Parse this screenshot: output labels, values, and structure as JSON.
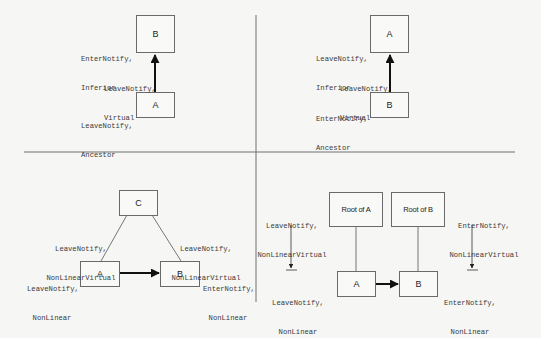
{
  "figure": {
    "colors": {
      "background": "#f6f6f4",
      "line": "#6a6a6a",
      "text": "#3a3a3a",
      "arrow": "#111111"
    }
  },
  "quadrants": {
    "top_left": {
      "boxes": {
        "upper": "B",
        "lower": "A"
      },
      "labels": {
        "upper": [
          "EnterNotify,",
          "Inferior"
        ],
        "arrow": [
          "LeaveNotify,",
          "Virtual"
        ],
        "lower": [
          "LeaveNotify,",
          "Ancestor"
        ]
      }
    },
    "top_right": {
      "boxes": {
        "upper": "A",
        "lower": "B"
      },
      "labels": {
        "upper": [
          "LeaveNotify,",
          "Inferior"
        ],
        "arrow": [
          "LeaveNotify,",
          "Virtual"
        ],
        "lower": [
          "EnterNotify,",
          "Ancestor"
        ]
      }
    },
    "bottom_left": {
      "boxes": {
        "top": "C",
        "left": "A",
        "right": "B"
      },
      "labels": {
        "left_edge": [
          "LeaveNotify,",
          "NonLinearVirtual"
        ],
        "right_edge": [
          "LeaveNotify,",
          "NonLinearVirtual"
        ],
        "left_box": [
          "LeaveNotify,",
          "NonLinear"
        ],
        "right_box": [
          "EnterNotify,",
          "NonLinear"
        ]
      }
    },
    "bottom_right": {
      "boxes": {
        "root_a": "Root of A",
        "root_b": "Root of B",
        "a": "A",
        "b": "B"
      },
      "labels": {
        "left_top": [
          "LeaveNotify,",
          "NonLinearVirtual"
        ],
        "left_bottom": [
          "LeaveNotify,",
          "NonLinear"
        ],
        "right_top": [
          "EnterNotify,",
          "NonLinearVirtual"
        ],
        "right_bottom": [
          "EnterNotify,",
          "NonLinear"
        ]
      }
    }
  }
}
